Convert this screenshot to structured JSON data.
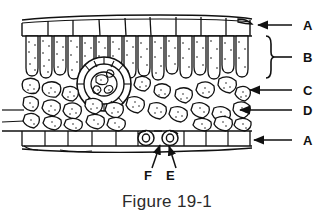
{
  "figure": {
    "caption": "Figure 19-1"
  },
  "labels": {
    "upper_epidermis": "A",
    "palisade_layer": "B",
    "mesophyll_cell": "C",
    "spongy_layer": "D",
    "lower_epidermis": "A",
    "guard_cell": "F",
    "stoma": "E"
  },
  "callouts": [
    {
      "id": "callout-a-upper",
      "text": "A",
      "label_x": 308,
      "label_y": 30,
      "line_x1": 292,
      "line_y1": 25,
      "line_x2": 258,
      "line_y2": 25,
      "type": "arrow"
    },
    {
      "id": "callout-b-palisade",
      "text": "B",
      "label_x": 308,
      "label_y": 62,
      "line_x1": 292,
      "line_y1": 57,
      "line_x2": 272,
      "line_y2": 57,
      "type": "brace"
    },
    {
      "id": "callout-c-mesophyll",
      "text": "C",
      "label_x": 308,
      "label_y": 95,
      "line_x1": 292,
      "line_y1": 90,
      "line_x2": 248,
      "line_y2": 90,
      "type": "arrow"
    },
    {
      "id": "callout-d-spongy",
      "text": "D",
      "label_x": 308,
      "label_y": 115,
      "line_x1": 292,
      "line_y1": 110,
      "line_x2": 238,
      "line_y2": 110,
      "type": "arrow"
    },
    {
      "id": "callout-a-lower",
      "text": "A",
      "label_x": 308,
      "label_y": 145,
      "line_x1": 292,
      "line_y1": 140,
      "line_x2": 252,
      "line_y2": 140,
      "type": "arrow"
    },
    {
      "id": "callout-f-guard",
      "text": "F",
      "label_x": 148,
      "label_y": 179,
      "line_x1": 153,
      "line_y1": 168,
      "line_x2": 161,
      "line_y2": 145,
      "type": "arrow"
    },
    {
      "id": "callout-e-stoma",
      "text": "E",
      "label_x": 169,
      "label_y": 179,
      "line_x1": 176,
      "line_y1": 168,
      "line_x2": 168,
      "line_y2": 146,
      "type": "arrow"
    }
  ],
  "colors": {
    "ink": "#111111",
    "caption": "#2b2b2b",
    "background": "#ffffff",
    "cell_fill": "#ffffff"
  },
  "structure": {
    "drawing_left": 22,
    "drawing_right": 252,
    "cuticle_y": 18,
    "upper_epidermis_top": 22,
    "upper_epidermis_bottom": 36,
    "palisade_top": 36,
    "palisade_bottom": 78,
    "spongy_top": 78,
    "spongy_bottom": 128,
    "lower_epidermis_top": 130,
    "lower_epidermis_bottom": 146,
    "vein_center_x": 104,
    "vein_center_y": 84,
    "vein_radius": 26
  }
}
